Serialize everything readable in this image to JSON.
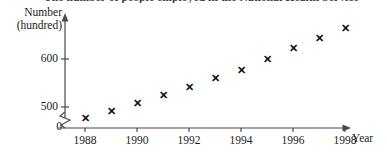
{
  "title_clipped": "The number of people employed in the National Health Service",
  "axes": {
    "y_label_line1": "Number",
    "y_label_line2": "(hundred)",
    "x_label": "Year",
    "y_ticks": [
      {
        "label": "500",
        "value": 500
      },
      {
        "label": "600",
        "value": 600
      }
    ],
    "origin_label": "0",
    "x_ticks": [
      "1988",
      "1990",
      "1992",
      "1994",
      "1996",
      "1998"
    ],
    "axis_break": "zigzag-break-icon"
  },
  "chart_data": {
    "type": "scatter",
    "title": "The number of people employed in the National Health Service",
    "xlabel": "Year",
    "ylabel": "Number (hundred)",
    "xlim": [
      1987.3,
      1999.0
    ],
    "ylim": [
      440,
      700
    ],
    "y_axis_broken": true,
    "y_break_below": 500,
    "grid": false,
    "legend": null,
    "marker_style": "x",
    "x": [
      1988,
      1989,
      1990,
      1991,
      1992,
      1993,
      1994,
      1995,
      1996,
      1997,
      1998
    ],
    "values": [
      478,
      492,
      508,
      525,
      542,
      560,
      577,
      600,
      623,
      644,
      665
    ],
    "points": [
      {
        "year": 1988,
        "value": 478
      },
      {
        "year": 1989,
        "value": 492
      },
      {
        "year": 1990,
        "value": 508
      },
      {
        "year": 1991,
        "value": 525
      },
      {
        "year": 1992,
        "value": 542
      },
      {
        "year": 1993,
        "value": 560
      },
      {
        "year": 1994,
        "value": 577
      },
      {
        "year": 1995,
        "value": 600
      },
      {
        "year": 1996,
        "value": 623
      },
      {
        "year": 1997,
        "value": 644
      },
      {
        "year": 1998,
        "value": 665
      }
    ]
  },
  "colors": {
    "axis": "#4a4a4a",
    "marker": "#111111",
    "text": "#1a1a1a"
  }
}
